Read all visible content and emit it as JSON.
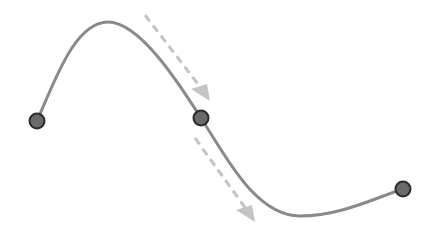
{
  "diagram": {
    "type": "spline-with-tangent-arrows",
    "colors": {
      "background": "#ffffff",
      "curve": "#8a8a8a",
      "point_fill": "#6a6a6a",
      "point_stroke": "#2b2b2b",
      "arrow": "#c4c4c4"
    },
    "control_points": [
      {
        "id": "p1",
        "x": 37,
        "y": 121
      },
      {
        "id": "p2",
        "x": 201,
        "y": 118
      },
      {
        "id": "p3",
        "x": 403,
        "y": 189
      }
    ],
    "curve_path": "M37,121 C55,80 75,22 108,22 C140,22 180,85 201,118 C225,155 255,216 300,216 C340,216 375,198 403,189",
    "arrows": [
      {
        "id": "tangent-in",
        "x1": 145,
        "y1": 15,
        "x2": 204,
        "y2": 92,
        "tip": "210,101 191,89 207,84"
      },
      {
        "id": "tangent-out",
        "x1": 195,
        "y1": 138,
        "x2": 249,
        "y2": 213,
        "tip": "255,222 236,210 252,205"
      }
    ]
  }
}
